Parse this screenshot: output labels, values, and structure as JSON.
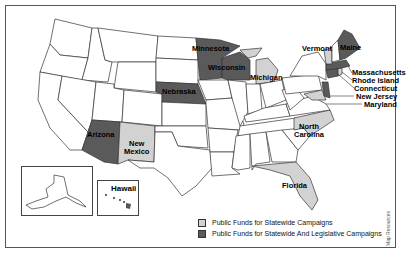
{
  "map": {
    "title": "",
    "colors": {
      "statewide_and_legislative": "#5a5a5a",
      "statewide_only": "#d2d2d2",
      "none": "#ffffff",
      "border": "#333333"
    },
    "states_statewide_and_legislative": [
      "Minnesota",
      "Wisconsin",
      "Nebraska",
      "Arizona",
      "Maine",
      "Connecticut",
      "Massachusetts",
      "New Jersey"
    ],
    "states_statewide_only": [
      "Michigan",
      "New Mexico",
      "Vermont",
      "North Carolina",
      "Florida",
      "Rhode Island",
      "Maryland"
    ],
    "labels": {
      "minnesota": "Minnesota",
      "wisconsin": "Wisconsin",
      "michigan": "Michigan",
      "nebraska": "Nebraska",
      "arizona": "Arizona",
      "new_mexico_1": "New",
      "new_mexico_2": "Mexico",
      "vermont": "Vermont",
      "maine": "Maine",
      "massachusetts": "Massachusetts",
      "rhode_island": "Rhode Island",
      "connecticut": "Connecticut",
      "new_jersey": "New Jersey",
      "maryland": "Maryland",
      "north_carolina_1": "North",
      "north_carolina_2": "Carolina",
      "florida": "Florida",
      "hawaii": "Hawaii"
    },
    "legend": {
      "items": [
        {
          "label": "Public Funds for Statewide Campaigns",
          "color": "#d2d2d2"
        },
        {
          "label": "Public Funds for Statewide And Legislative Campaigns",
          "color": "#5a5a5a"
        }
      ]
    },
    "credit": "Map Resources"
  }
}
